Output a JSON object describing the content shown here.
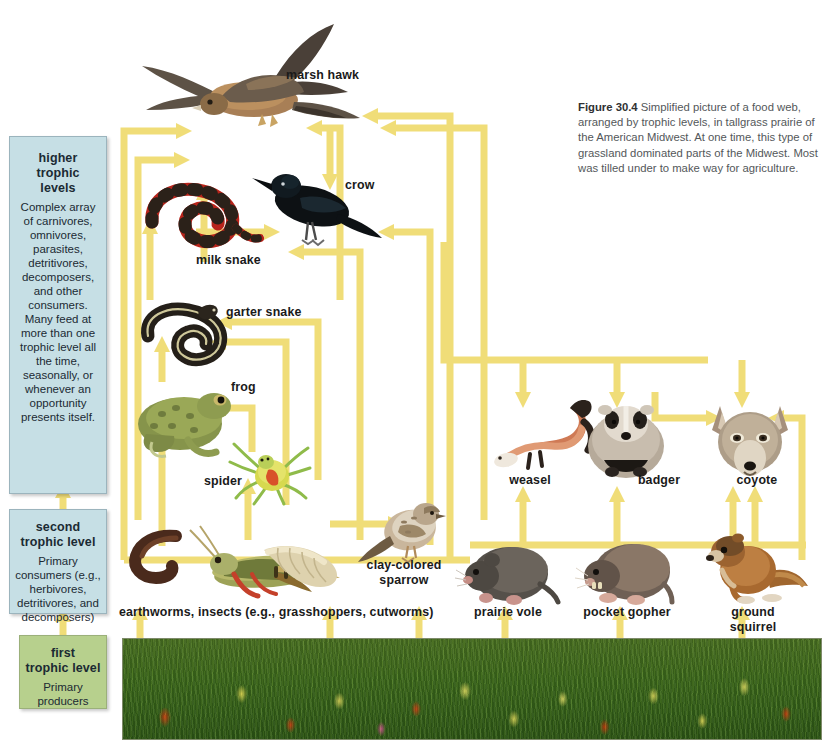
{
  "figure": {
    "caption_number": "Figure 30.4",
    "caption_text": "Simplified picture of a food web, arranged by trophic levels, in tallgrass prairie of the American Midwest. At one time, this type of grassland dominated parts of the Midwest. Most was tilled under to make way for agriculture."
  },
  "trophic_levels": [
    {
      "id": "higher",
      "title": "higher trophic\nlevels",
      "body": "Complex array of carnivores, omnivores, parasites, detritivores, decomposers, and other consumers. Many feed at more than one trophic level all the time, seasonally, or whenever an opportunity presents itself.",
      "color": "#c6dfe5"
    },
    {
      "id": "second",
      "title": "second\ntrophic level",
      "body": "Primary consumers (e.g., herbivores, detritivores, and decomposers)",
      "color": "#c6dfe5"
    },
    {
      "id": "first",
      "title": "first\ntrophic level",
      "body": "Primary producers",
      "color": "#b7d08d"
    }
  ],
  "organisms": [
    {
      "id": "marsh-hawk",
      "label": "marsh hawk"
    },
    {
      "id": "crow",
      "label": "crow"
    },
    {
      "id": "milk-snake",
      "label": "milk snake"
    },
    {
      "id": "garter-snake",
      "label": "garter snake"
    },
    {
      "id": "frog",
      "label": "frog"
    },
    {
      "id": "spider",
      "label": "spider"
    },
    {
      "id": "weasel",
      "label": "weasel"
    },
    {
      "id": "badger",
      "label": "badger"
    },
    {
      "id": "coyote",
      "label": "coyote"
    },
    {
      "id": "clay-colored-sparrow",
      "label": "clay-colored\nsparrow"
    },
    {
      "id": "detritivores",
      "label": "earthworms, insects (e.g., grasshoppers, cutworms)"
    },
    {
      "id": "prairie-vole",
      "label": "prairie vole"
    },
    {
      "id": "pocket-gopher",
      "label": "pocket gopher"
    },
    {
      "id": "ground-squirrel",
      "label": "ground squirrel"
    }
  ],
  "colors": {
    "arrow": "#f0dd78",
    "box_blue": "#c6dfe5",
    "box_green": "#b7d08d",
    "label_text": "#1a1a1a",
    "caption_text": "#53575a",
    "prairie_green": "#3f6a1d"
  }
}
